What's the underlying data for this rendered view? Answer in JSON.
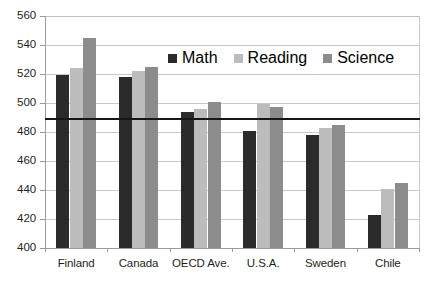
{
  "chart_data": {
    "type": "bar",
    "title": "",
    "subtitle": "",
    "xlabel": "",
    "ylabel": "",
    "ylim": [
      400,
      560
    ],
    "ytick_step": 20,
    "yticks": [
      400,
      420,
      440,
      460,
      480,
      500,
      520,
      540,
      560
    ],
    "grid": true,
    "grid_axis": "y",
    "legend_position": "inside-top-center",
    "categories": [
      "Finland",
      "Canada",
      "OECD Ave.",
      "U.S.A.",
      "Sweden",
      "Chile"
    ],
    "series": [
      {
        "name": "Math",
        "color": "#2b2b2b",
        "values": [
          519,
          518,
          494,
          481,
          478,
          423
        ]
      },
      {
        "name": "Reading",
        "color": "#bcbcbc",
        "values": [
          524,
          522,
          496,
          499,
          483,
          441
        ]
      },
      {
        "name": "Science",
        "color": "#8c8c8c",
        "values": [
          545,
          525,
          501,
          497,
          485,
          445
        ]
      }
    ],
    "annotations": [
      {
        "type": "hline",
        "name": "oecd-average-reference-line",
        "value": 490,
        "color": "#171717"
      }
    ]
  },
  "legend": {
    "items": [
      {
        "label": "Math"
      },
      {
        "label": "Reading"
      },
      {
        "label": "Science"
      }
    ]
  },
  "axis": {
    "y_tick_labels": [
      "560",
      "540",
      "520",
      "500",
      "480",
      "460",
      "440",
      "420",
      "400"
    ],
    "x_tick_labels": [
      "Finland",
      "Canada",
      "OECD Ave.",
      "U.S.A.",
      "Sweden",
      "Chile"
    ]
  }
}
